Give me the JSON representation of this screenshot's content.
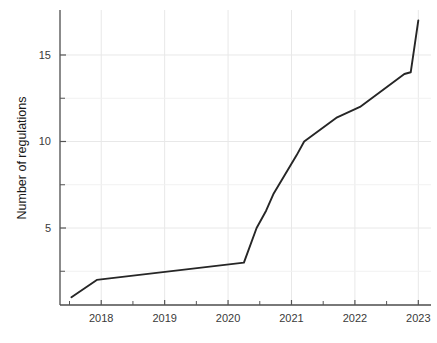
{
  "chart_data": {
    "type": "line",
    "title": "",
    "subtitle": "",
    "xlabel": "",
    "ylabel": "Number of regulations",
    "xlim": [
      2017.35,
      2023.2
    ],
    "ylim": [
      0.55,
      17.6
    ],
    "grid": true,
    "legend": false,
    "legend_position": "none",
    "line_color": "#262626",
    "grid_color": "#e8e8e8",
    "axis_color": "#555555",
    "background_color": "#ffffff",
    "x_tick_labels": [
      "2018",
      "2019",
      "2020",
      "2021",
      "2022",
      "2023"
    ],
    "x_ticks": [
      2018,
      2019,
      2020,
      2021,
      2022,
      2023
    ],
    "x_minor_ticks": [
      2017.5,
      2018.5,
      2019.5,
      2020.5,
      2021.5,
      2022.5
    ],
    "y_tick_labels": [
      "5",
      "10",
      "15"
    ],
    "y_ticks": [
      5,
      10,
      15
    ],
    "y_minor_ticks": [
      2.5,
      7.5,
      12.5
    ],
    "series": [
      {
        "name": "Cumulative regulations",
        "color": "#262626",
        "x": [
          2017.53,
          2017.93,
          2020.25,
          2020.45,
          2020.6,
          2020.72,
          2021.08,
          2021.2,
          2021.72,
          2022.08,
          2022.78,
          2022.88,
          2023.0
        ],
        "y": [
          1,
          2,
          3,
          5,
          6,
          7,
          9.2,
          10,
          11.4,
          12,
          13.9,
          14,
          17
        ]
      }
    ]
  },
  "axes": {
    "y_axis_title": "Number of regulations"
  }
}
